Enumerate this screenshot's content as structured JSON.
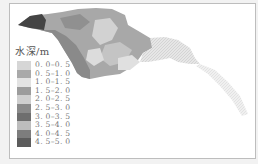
{
  "figure": {
    "legend": {
      "title": "水深/m",
      "items": [
        {
          "label": "0. 0–0. 5",
          "color": "#d6d6d6"
        },
        {
          "label": "0. 5–1. 0",
          "color": "#a9a9a9"
        },
        {
          "label": "1. 0–1. 5",
          "color": "#e3e3e3"
        },
        {
          "label": "1. 5–2. 0",
          "color": "#9c9c9c"
        },
        {
          "label": "2. 0–2. 5",
          "color": "#cfcfcf"
        },
        {
          "label": "2. 5–3. 0",
          "color": "#8a8a8a"
        },
        {
          "label": "3. 0–3. 5",
          "color": "#6e6e6e"
        },
        {
          "label": "3. 5–4. 0",
          "color": "#bdbdbd"
        },
        {
          "label": "4. 0–4. 5",
          "color": "#7d7d7d"
        },
        {
          "label": "4. 5–5. 0",
          "color": "#5c5c5c"
        }
      ]
    }
  }
}
